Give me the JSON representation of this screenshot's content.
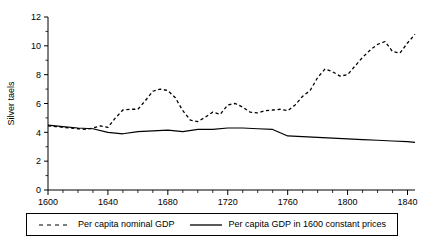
{
  "chart_data": {
    "type": "line",
    "title": "",
    "xlabel": "",
    "ylabel": "Silver taels",
    "xlim": [
      1600,
      1845
    ],
    "ylim": [
      0,
      12
    ],
    "xticks": [
      1600,
      1640,
      1680,
      1720,
      1760,
      1800,
      1840
    ],
    "yticks": [
      0,
      2,
      4,
      6,
      8,
      10,
      12
    ],
    "xtick_labels": [
      "1600",
      "1640",
      "1680",
      "1720",
      "1760",
      "1800",
      "1840"
    ],
    "ytick_labels": [
      "0",
      "2",
      "4",
      "6",
      "8",
      "10",
      "12"
    ],
    "x_minor_tick_interval": 10,
    "y_minor_tick_interval": 1,
    "grid": false,
    "legend_position": "below-plot",
    "series": [
      {
        "name": "Per capita nominal GDP",
        "style": "dashed",
        "color": "#000000",
        "x": [
          1600,
          1605,
          1610,
          1615,
          1620,
          1625,
          1630,
          1635,
          1640,
          1645,
          1650,
          1655,
          1660,
          1665,
          1670,
          1675,
          1680,
          1685,
          1690,
          1695,
          1700,
          1705,
          1710,
          1715,
          1720,
          1725,
          1730,
          1735,
          1740,
          1745,
          1750,
          1755,
          1760,
          1765,
          1770,
          1775,
          1780,
          1785,
          1790,
          1795,
          1800,
          1805,
          1810,
          1815,
          1820,
          1825,
          1830,
          1835,
          1840,
          1845
        ],
        "values": [
          4.45,
          4.4,
          4.35,
          4.3,
          4.25,
          4.2,
          4.3,
          4.45,
          4.35,
          5.0,
          5.55,
          5.6,
          5.6,
          6.2,
          6.85,
          7.0,
          6.9,
          6.4,
          5.5,
          4.85,
          4.75,
          5.05,
          5.4,
          5.25,
          5.9,
          6.0,
          5.75,
          5.4,
          5.35,
          5.5,
          5.55,
          5.6,
          5.5,
          5.9,
          6.5,
          6.9,
          7.8,
          8.4,
          8.2,
          7.9,
          8.0,
          8.6,
          9.2,
          9.7,
          10.1,
          10.3,
          9.6,
          9.5,
          10.2,
          10.8
        ]
      },
      {
        "name": "Per capita GDP in 1600 constant prices",
        "style": "solid",
        "color": "#000000",
        "x": [
          1600,
          1610,
          1620,
          1630,
          1640,
          1650,
          1660,
          1670,
          1680,
          1690,
          1700,
          1710,
          1720,
          1730,
          1740,
          1750,
          1760,
          1770,
          1780,
          1790,
          1800,
          1810,
          1820,
          1830,
          1840,
          1845
        ],
        "values": [
          4.5,
          4.4,
          4.3,
          4.25,
          4.0,
          3.9,
          4.05,
          4.1,
          4.15,
          4.05,
          4.2,
          4.2,
          4.3,
          4.3,
          4.25,
          4.2,
          3.75,
          3.7,
          3.65,
          3.6,
          3.55,
          3.5,
          3.45,
          3.4,
          3.35,
          3.3
        ]
      }
    ]
  },
  "legend": {
    "entries": [
      {
        "label": "Per capita nominal GDP",
        "style": "dashed"
      },
      {
        "label": "Per capita GDP in 1600 constant prices",
        "style": "solid"
      }
    ]
  },
  "axes": {
    "y_title": "Silver taels"
  }
}
